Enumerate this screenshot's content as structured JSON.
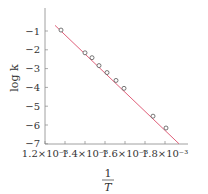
{
  "chart_data": {
    "type": "scatter",
    "title": "",
    "xlabel": "1/T",
    "ylabel": "log k",
    "xlim": [
      0.0012,
      0.00187
    ],
    "ylim": [
      -7,
      -0.3
    ],
    "grid": false,
    "legend": null,
    "x_ticks": [
      0.0012,
      0.0013,
      0.0014,
      0.0015,
      0.0016,
      0.0017,
      0.0018
    ],
    "x_tick_labels": [
      "1.2×10⁻³",
      "",
      "1.4×10⁻³",
      "",
      "1.6×10⁻³",
      "",
      "1.8×10⁻³"
    ],
    "y_ticks": [
      -1,
      -2,
      -3,
      -4,
      -5,
      -6,
      -7
    ],
    "y_tick_labels": [
      "−1",
      "−2",
      "−3",
      "−4",
      "−5",
      "−6",
      "−7"
    ],
    "series": [
      {
        "name": "data",
        "marker": "open-circle",
        "color": "#555555",
        "x": [
          0.00128,
          0.0014,
          0.001435,
          0.00147,
          0.00151,
          0.001555,
          0.001595,
          0.00174,
          0.001805
        ],
        "y": [
          -0.95,
          -2.16,
          -2.42,
          -2.84,
          -3.21,
          -3.63,
          -4.05,
          -5.53,
          -6.16
        ]
      },
      {
        "name": "fit",
        "type": "line",
        "color": "#e0607a",
        "x": [
          0.00125,
          0.00187
        ],
        "y": [
          -0.7,
          -7.0
        ]
      }
    ]
  },
  "axes": {
    "xlabel_num": "1",
    "xlabel_den": "T",
    "ylabel": "log k"
  }
}
